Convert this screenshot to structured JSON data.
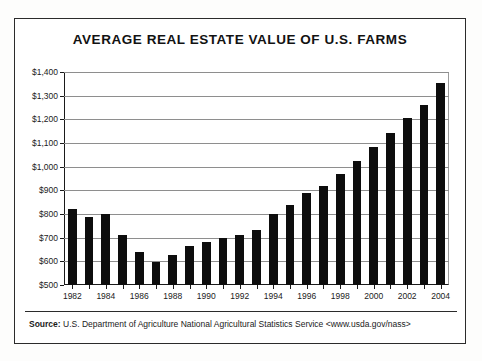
{
  "chart_data": {
    "type": "bar",
    "title": "AVERAGE REAL ESTATE VALUE OF U.S. FARMS",
    "xlabel": "",
    "ylabel": "Dollars  per  Acre",
    "ylim": [
      500,
      1400
    ],
    "ytick_step": 100,
    "grid": true,
    "legend": null,
    "categories": [
      "1982",
      "1983",
      "1984",
      "1985",
      "1986",
      "1987",
      "1988",
      "1989",
      "1990",
      "1991",
      "1992",
      "1993",
      "1994",
      "1995",
      "1996",
      "1997",
      "1998",
      "1999",
      "2000",
      "2001",
      "2002",
      "2003",
      "2004"
    ],
    "values": [
      820,
      788,
      798,
      712,
      638,
      598,
      628,
      665,
      680,
      700,
      710,
      732,
      798,
      838,
      888,
      920,
      968,
      1023,
      1085,
      1143,
      1205,
      1262,
      1352
    ],
    "ytick_labels": [
      "$1,400",
      "$1,300",
      "$1,200",
      "$1,100",
      "$1,000",
      "$900",
      "$800",
      "$700",
      "$600",
      "$500"
    ],
    "ytick_values": [
      1400,
      1300,
      1200,
      1100,
      1000,
      900,
      800,
      700,
      600,
      500
    ],
    "xtick_labels": [
      "1982",
      "1984",
      "1986",
      "1988",
      "1990",
      "1992",
      "1994",
      "1996",
      "1998",
      "2000",
      "2002",
      "2004"
    ],
    "bar_color": "#0d0d0d",
    "grid_color": "#8e8e8e",
    "axis_color": "#1a1a1a"
  },
  "footer": {
    "source_label": "Source:",
    "source_text": " U.S. Department of Agriculture National Agricultural Statistics Service  <www.usda.gov/nass>"
  }
}
